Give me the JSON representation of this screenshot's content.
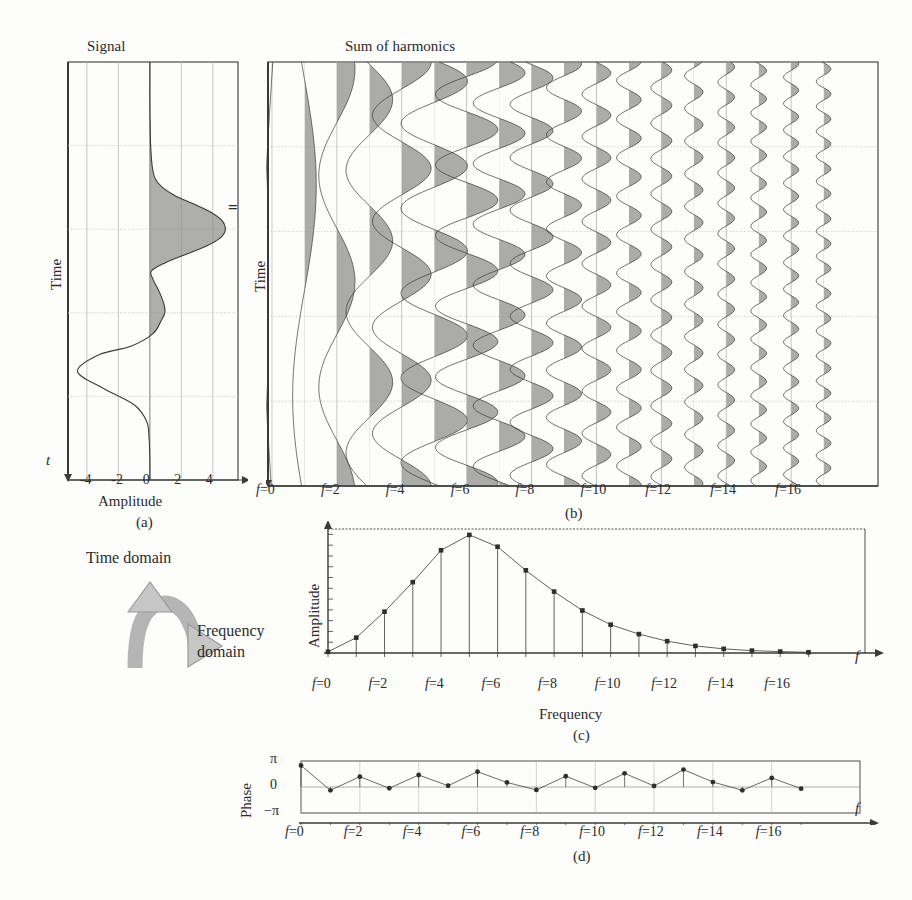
{
  "figure": {
    "panel_a": {
      "title": "Signal",
      "y_axis_label": "Time",
      "x_axis_label": "Amplitude",
      "time_arrow_label": "t",
      "x_ticks": [
        "-4",
        "-2",
        "0",
        "2",
        "4"
      ],
      "caption": "(a)"
    },
    "operator": "=",
    "panel_b": {
      "title": "Sum of harmonics",
      "y_axis_label": "Time",
      "x_ticks": [
        "f=0",
        "f=2",
        "f=4",
        "f=6",
        "f=8",
        "f=10",
        "f=12",
        "f=14",
        "f=16"
      ],
      "caption": "(b)"
    },
    "domain_arrow": {
      "top_label": "Time domain",
      "bottom_label_line1": "Frequency",
      "bottom_label_line2": "domain"
    },
    "panel_c": {
      "y_axis_label": "Amplitude",
      "x_axis_label": "Frequency",
      "f_label": "f",
      "x_ticks": [
        "f=0",
        "f=2",
        "f=4",
        "f=6",
        "f=8",
        "f=10",
        "f=12",
        "f=14",
        "f=16"
      ],
      "caption": "(c)"
    },
    "panel_d": {
      "y_axis_label": "Phase",
      "f_label": "f",
      "y_ticks": [
        "π",
        "0",
        "−π"
      ],
      "x_ticks": [
        "f=0",
        "f=2",
        "f=4",
        "f=6",
        "f=8",
        "f=10",
        "f=12",
        "f=14",
        "f=16"
      ],
      "caption": "(d)"
    },
    "colors": {
      "ink": "#3a3a3a",
      "fill": "#8f8f8f",
      "grid": "#b9b9b9",
      "paper": "#fdfdfb"
    }
  },
  "chart_data": [
    {
      "type": "line",
      "id": "panel-a-signal",
      "title": "Signal",
      "xlabel": "Amplitude",
      "ylabel": "Time",
      "xlim": [
        -5.2,
        5.6
      ],
      "orientation": "vertical-time",
      "grid": true,
      "note": "Amplitude plotted horizontally vs time running downward; positive lobes shaded",
      "x_tick_values": [
        -4,
        -2,
        0,
        2,
        4
      ],
      "t": [
        0.0,
        0.05,
        0.1,
        0.15,
        0.2,
        0.25,
        0.28,
        0.3,
        0.32,
        0.34,
        0.36,
        0.38,
        0.4,
        0.42,
        0.44,
        0.46,
        0.48,
        0.5,
        0.52,
        0.55,
        0.58,
        0.6,
        0.62,
        0.65,
        0.68,
        0.7,
        0.74,
        0.78,
        0.82,
        0.86,
        0.9,
        0.95,
        1.0
      ],
      "amplitude": [
        0.0,
        0.0,
        0.0,
        0.02,
        0.05,
        0.15,
        0.35,
        0.8,
        1.6,
        2.8,
        3.9,
        4.6,
        4.8,
        4.5,
        3.6,
        2.3,
        1.0,
        0.1,
        0.2,
        0.6,
        0.9,
        0.95,
        0.7,
        0.2,
        -1.2,
        -3.2,
        -4.6,
        -3.0,
        -1.0,
        -0.2,
        -0.05,
        0.0,
        0.0
      ]
    },
    {
      "type": "line",
      "id": "panel-b-harmonics",
      "title": "Sum of harmonics",
      "ylabel": "Time",
      "xlabel": "",
      "grid": true,
      "harmonic_count": 18,
      "harmonics": [
        0,
        1,
        2,
        3,
        4,
        5,
        6,
        7,
        8,
        9,
        10,
        11,
        12,
        13,
        14,
        15,
        16,
        17
      ],
      "x_tick_values": [
        0,
        2,
        4,
        6,
        8,
        10,
        12,
        14,
        16
      ],
      "amplitudes": [
        0.06,
        0.18,
        0.42,
        0.62,
        0.85,
        1.0,
        0.92,
        0.72,
        0.55,
        0.4,
        0.28,
        0.2,
        0.13,
        0.08,
        0.05,
        0.03,
        0.02,
        0.01
      ],
      "phases": [
        3.05,
        -0.25,
        1.35,
        -0.1,
        1.55,
        0.15,
        1.85,
        0.45,
        -0.3,
        1.3,
        -0.05,
        1.7,
        0.12,
        2.05,
        0.55,
        -0.35,
        1.15,
        -0.2
      ],
      "note": "Each harmonic drawn as a vertical sinusoid at its own f position; positive half-cycles shaded"
    },
    {
      "type": "scatter",
      "id": "panel-c-spectrum",
      "title": "",
      "xlabel": "Frequency",
      "ylabel": "Amplitude",
      "legend": "none",
      "grid": false,
      "xlim": [
        0,
        19
      ],
      "ylim": [
        0,
        1.05
      ],
      "x_tick_values": [
        0,
        2,
        4,
        6,
        8,
        10,
        12,
        14,
        16
      ],
      "x": [
        0,
        1,
        2,
        3,
        4,
        5,
        6,
        7,
        8,
        9,
        10,
        11,
        12,
        13,
        14,
        15,
        16,
        17
      ],
      "values": [
        0.01,
        0.13,
        0.35,
        0.6,
        0.87,
        1.0,
        0.9,
        0.7,
        0.52,
        0.36,
        0.24,
        0.16,
        0.1,
        0.06,
        0.035,
        0.02,
        0.012,
        0.006
      ],
      "stems": true
    },
    {
      "type": "scatter",
      "id": "panel-d-phase",
      "title": "",
      "xlabel": "",
      "ylabel": "Phase",
      "grid": false,
      "xlim": [
        0,
        19
      ],
      "ylim": [
        -3.1416,
        3.1416
      ],
      "y_tick_values": [
        3.1416,
        0,
        -3.1416
      ],
      "y_tick_labels": [
        "π",
        "0",
        "−π"
      ],
      "x_tick_values": [
        0,
        2,
        4,
        6,
        8,
        10,
        12,
        14,
        16
      ],
      "x": [
        0,
        1,
        2,
        3,
        4,
        5,
        6,
        7,
        8,
        9,
        10,
        11,
        12,
        13,
        14,
        15,
        16,
        17
      ],
      "values": [
        2.6,
        -0.4,
        1.25,
        -0.15,
        1.45,
        0.15,
        1.85,
        0.55,
        -0.35,
        1.3,
        -0.1,
        1.65,
        0.12,
        2.1,
        0.6,
        -0.4,
        1.1,
        -0.2
      ],
      "stems": true
    }
  ]
}
